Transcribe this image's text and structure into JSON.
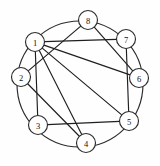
{
  "figure": {
    "name": "circulant-graph-diagram",
    "type": "undirected-graph",
    "background_color": "#fefefe",
    "stroke_color": "#1f1f1f",
    "node_fill_color": "#ffffff",
    "canvas": {
      "width": 160,
      "height": 166
    }
  },
  "ring": {
    "center_x": 80,
    "center_y": 84,
    "radius": 63,
    "label": "outer-circle"
  },
  "nodes": [
    {
      "id": "1",
      "label": "1",
      "x": 35,
      "y": 42,
      "r": 9.5,
      "angle_deg": 157.5
    },
    {
      "id": "2",
      "label": "2",
      "x": 21,
      "y": 77,
      "r": 9.5,
      "angle_deg": 202.5
    },
    {
      "id": "3",
      "label": "3",
      "x": 38,
      "y": 125,
      "r": 9.5,
      "angle_deg": 247.5
    },
    {
      "id": "4",
      "label": "4",
      "x": 86,
      "y": 143,
      "r": 9.5,
      "angle_deg": 292.5
    },
    {
      "id": "5",
      "label": "5",
      "x": 129,
      "y": 121,
      "r": 9.5,
      "angle_deg": 337.5
    },
    {
      "id": "6",
      "label": "6",
      "x": 139,
      "y": 78,
      "r": 9.5,
      "angle_deg": 22.5
    },
    {
      "id": "7",
      "label": "7",
      "x": 126,
      "y": 39,
      "r": 9.5,
      "angle_deg": 67.5
    },
    {
      "id": "8",
      "label": "8",
      "x": 88,
      "y": 20,
      "r": 9.5,
      "angle_deg": 112.5
    }
  ],
  "edges": [
    {
      "from": "1",
      "to": "7",
      "kind": "chord"
    },
    {
      "from": "1",
      "to": "6",
      "kind": "chord"
    },
    {
      "from": "1",
      "to": "5",
      "kind": "chord"
    },
    {
      "from": "1",
      "to": "4",
      "kind": "chord"
    },
    {
      "from": "1",
      "to": "3",
      "kind": "chord"
    },
    {
      "from": "8",
      "to": "2",
      "kind": "chord"
    },
    {
      "from": "8",
      "to": "6",
      "kind": "chord"
    },
    {
      "from": "2",
      "to": "4",
      "kind": "chord"
    },
    {
      "from": "3",
      "to": "5",
      "kind": "chord"
    },
    {
      "from": "7",
      "to": "5",
      "kind": "chord"
    }
  ],
  "chart_data": {
    "type": "diagram",
    "title": "",
    "node_count": 8,
    "edge_count": 10,
    "node_labels": [
      "1",
      "2",
      "3",
      "4",
      "5",
      "6",
      "7",
      "8"
    ],
    "adjacency": {
      "1": [
        "3",
        "4",
        "5",
        "6",
        "7"
      ],
      "2": [
        "4",
        "8"
      ],
      "3": [
        "1",
        "5"
      ],
      "4": [
        "1",
        "2"
      ],
      "5": [
        "1",
        "3",
        "7"
      ],
      "6": [
        "1",
        "8"
      ],
      "7": [
        "1",
        "5"
      ],
      "8": [
        "2",
        "6"
      ]
    },
    "edge_list": [
      [
        "1",
        "7"
      ],
      [
        "1",
        "6"
      ],
      [
        "1",
        "5"
      ],
      [
        "1",
        "4"
      ],
      [
        "1",
        "3"
      ],
      [
        "8",
        "2"
      ],
      [
        "8",
        "6"
      ],
      [
        "2",
        "4"
      ],
      [
        "3",
        "5"
      ],
      [
        "7",
        "5"
      ]
    ],
    "layout": "circular",
    "legend": []
  }
}
